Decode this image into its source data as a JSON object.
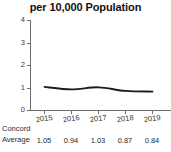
{
  "chart_data": {
    "type": "line",
    "title": "per 10,000 Population",
    "xlabel": "",
    "ylabel": "",
    "categories": [
      "2015",
      "2016",
      "2017",
      "2018",
      "2019"
    ],
    "values": [
      1.05,
      0.94,
      1.03,
      0.87,
      0.84
    ],
    "series": [
      {
        "name": "Concord Average",
        "values": [
          1.05,
          0.94,
          1.03,
          0.87,
          0.84
        ]
      }
    ],
    "ylim": [
      0,
      4
    ],
    "yticks": [
      0,
      1,
      2,
      3,
      4
    ],
    "ytick_labels": [
      "0",
      "1",
      "2",
      "3",
      "4"
    ],
    "xtick_labels": [
      "2015",
      "2016",
      "2017",
      "2018",
      "2019"
    ],
    "grid": false,
    "legend": "none",
    "line_color": "#1c1c1c",
    "axis_color": "#6e6e6e"
  },
  "table": {
    "row_label_line1": "Concord",
    "row_label_line2": "Average",
    "values": [
      "1.05",
      "0.94",
      "1.03",
      "0.87",
      "0.84"
    ]
  }
}
